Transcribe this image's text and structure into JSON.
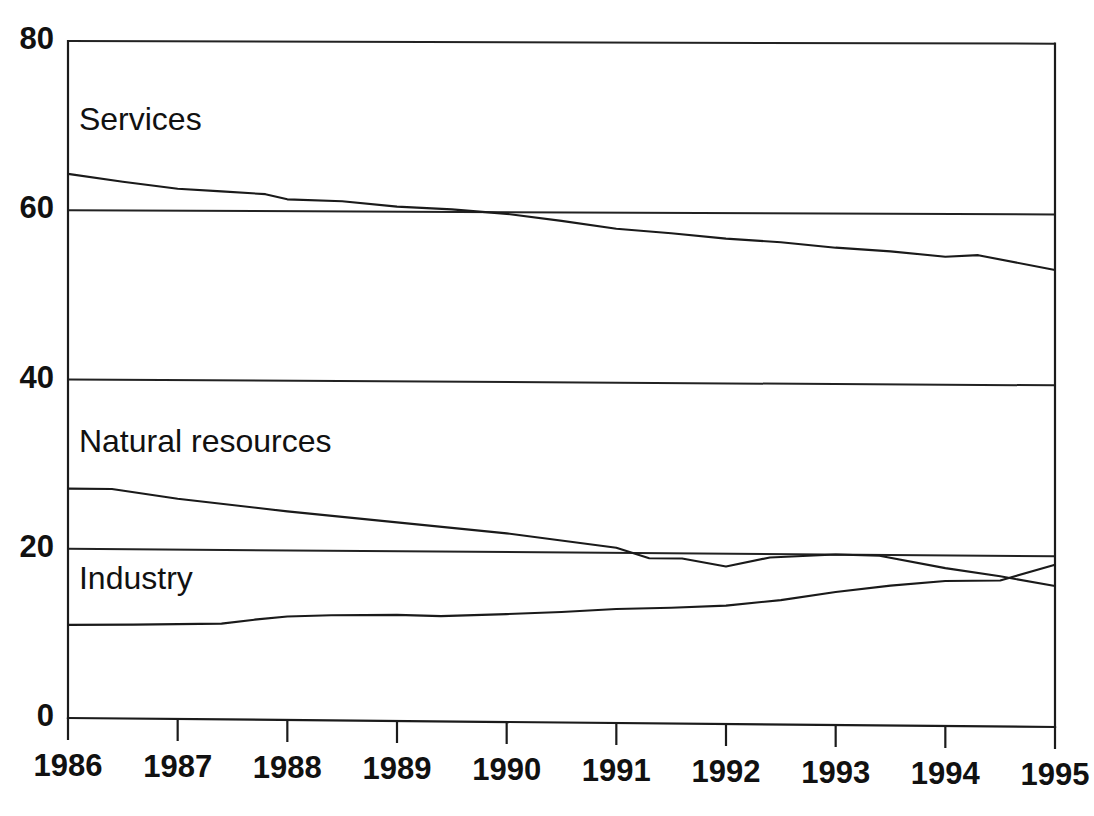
{
  "chart_data": {
    "type": "line",
    "title": "",
    "subtitle": "",
    "xlabel": "",
    "ylabel": "",
    "xlim": [
      1986,
      1995
    ],
    "ylim": [
      0,
      80
    ],
    "grid": true,
    "grid_axis": "y",
    "legend_position": "inline-annotations",
    "x": [
      1986,
      1987,
      1988,
      1989,
      1990,
      1991,
      1992,
      1993,
      1994,
      1995
    ],
    "yticks": [
      0,
      20,
      40,
      60,
      80
    ],
    "ytick_labels": [
      "0",
      "20",
      "40",
      "60",
      "80"
    ],
    "xticks": [
      1986,
      1987,
      1988,
      1989,
      1990,
      1991,
      1992,
      1993,
      1994,
      1995
    ],
    "xtick_labels": [
      "1986",
      "1987",
      "1988",
      "1989",
      "1990",
      "1991",
      "1992",
      "1993",
      "1994",
      "1995"
    ],
    "series": [
      {
        "name": "Services",
        "label": "Services",
        "color": "#1a1a1a",
        "values": [
          64.3,
          62.6,
          61.4,
          60.6,
          59.8,
          58.1,
          57.0,
          56.0,
          55.0,
          53.5
        ],
        "detail_x": [
          1986,
          1986.5,
          1987,
          1987.4,
          1987.8,
          1988,
          1988.5,
          1989,
          1989.5,
          1990,
          1990.5,
          1991,
          1991.5,
          1992,
          1992.5,
          1993,
          1993.5,
          1994,
          1994.3,
          1995
        ],
        "detail_y": [
          64.3,
          63.4,
          62.6,
          62.3,
          62.0,
          61.4,
          61.2,
          60.6,
          60.3,
          59.8,
          59.0,
          58.1,
          57.6,
          57.0,
          56.6,
          56.0,
          55.6,
          55.0,
          55.2,
          53.5
        ]
      },
      {
        "name": "Natural resources",
        "label": "Natural resources",
        "color": "#1a1a1a",
        "values": [
          27.1,
          26.0,
          24.6,
          23.4,
          22.2,
          20.6,
          18.5,
          20.0,
          18.5,
          16.5
        ],
        "detail_x": [
          1986,
          1986.4,
          1987,
          1988,
          1989,
          1990,
          1991,
          1991.3,
          1991.6,
          1992,
          1992.4,
          1993,
          1993.4,
          1994,
          1994.5,
          1995
        ],
        "detail_y": [
          27.1,
          27.1,
          26.0,
          24.6,
          23.4,
          22.2,
          20.6,
          19.4,
          19.4,
          18.5,
          19.6,
          20.0,
          19.9,
          18.5,
          17.6,
          16.5
        ]
      },
      {
        "name": "Industry",
        "label": "Industry",
        "color": "#1a1a1a",
        "values": [
          11.0,
          11.2,
          12.2,
          12.5,
          12.7,
          13.4,
          13.9,
          15.6,
          17.0,
          19.0
        ],
        "detail_x": [
          1986,
          1986.6,
          1987,
          1987.4,
          1987.7,
          1988,
          1988.4,
          1989,
          1989.4,
          1990,
          1990.5,
          1991,
          1991.5,
          1992,
          1992.5,
          1993,
          1993.5,
          1994,
          1994.5,
          1995
        ],
        "detail_y": [
          11.0,
          11.1,
          11.2,
          11.3,
          11.8,
          12.2,
          12.4,
          12.5,
          12.4,
          12.7,
          13.0,
          13.4,
          13.6,
          13.9,
          14.6,
          15.6,
          16.4,
          17.0,
          17.1,
          19.0
        ]
      }
    ],
    "annotations": [
      {
        "text": "Services",
        "x": 1986.1,
        "y": 69.5
      },
      {
        "text": "Natural resources",
        "x": 1986.1,
        "y": 31.5
      },
      {
        "text": "Industry",
        "x": 1986.1,
        "y": 15.2
      }
    ]
  }
}
